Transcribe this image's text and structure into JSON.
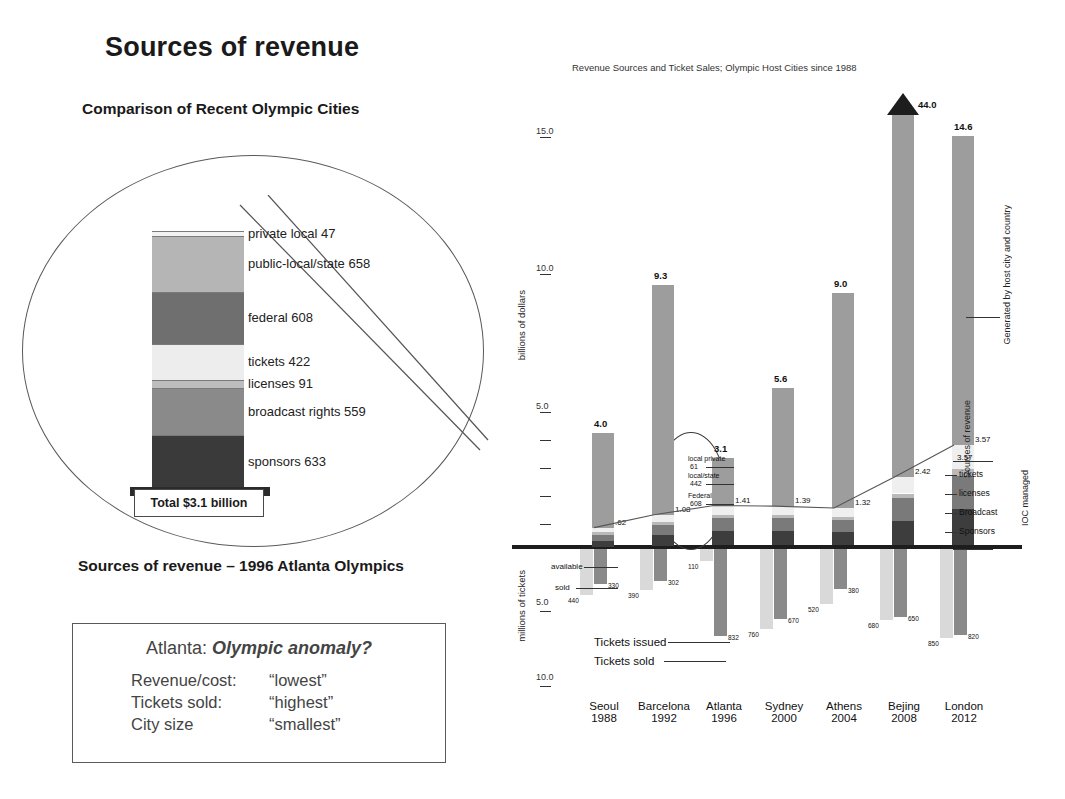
{
  "slide": {
    "title": "Sources of revenue",
    "compare_subtitle": "Comparison of Recent Olympic Cities",
    "atlanta_caption": "Sources of revenue – 1996 Atlanta Olympics"
  },
  "callout": {
    "total_label": "Total $3.1 billion",
    "segments": [
      {
        "label": "private  local  47",
        "value": 47,
        "color": "#f2f2f2"
      },
      {
        "label": "public-local/state 658",
        "value": 658,
        "color": "#b5b5b5"
      },
      {
        "label": "federal 608",
        "value": 608,
        "color": "#6f6f6f"
      },
      {
        "label": "tickets  422",
        "value": 422,
        "color": "#ededed"
      },
      {
        "label": "licenses  91",
        "value": 91,
        "color": "#bdbdbd"
      },
      {
        "label": "broadcast rights  559",
        "value": 559,
        "color": "#8a8a8a"
      },
      {
        "label": "sponsors  633",
        "value": 633,
        "color": "#3a3a3a"
      }
    ]
  },
  "anomaly": {
    "title_prefix": "Atlanta: ",
    "title_italic": "Olympic anomaly?",
    "rows": [
      {
        "key": "Revenue/cost:",
        "value": "“lowest”"
      },
      {
        "key": "Tickets sold:",
        "value": "“highest”"
      },
      {
        "key": "City size",
        "value": "“smallest”"
      }
    ]
  },
  "chart_data": {
    "type": "bar",
    "title": "Revenue Sources and Ticket Sales; Olympic Host Cities since 1988",
    "ylabel_top": "billions of dollars",
    "ylabel_bottom": "millions of tickets",
    "yticks_top": [
      "15.0",
      "10.0",
      "5.0"
    ],
    "yticks_bottom": [
      "5.0",
      "10.0"
    ],
    "categories": [
      "Seoul",
      "Barcelona",
      "Atlanta",
      "Sydney",
      "Athens",
      "Bejing",
      "London"
    ],
    "years": [
      "1988",
      "1992",
      "1996",
      "2000",
      "2004",
      "2008",
      "2012"
    ],
    "series": [
      {
        "name": "Total revenue (billions $)",
        "values": [
          4.0,
          9.3,
          3.1,
          5.6,
          9.0,
          44.0,
          14.6
        ]
      },
      {
        "name": "IOC-managed sources (billions $)",
        "values": [
          0.62,
          1.08,
          1.41,
          1.39,
          1.32,
          2.42,
          3.57
        ]
      },
      {
        "name": "Tickets issued (millions)",
        "values": [
          440,
          390,
          110,
          760,
          520,
          680,
          850
        ]
      },
      {
        "name": "Tickets sold (millions)",
        "values": [
          330,
          302,
          832,
          670,
          380,
          650,
          820
        ]
      }
    ],
    "value_labels_top": [
      "4.0",
      "9.3",
      "3.1",
      "5.6",
      "9.0",
      "44.0",
      "14.6"
    ],
    "value_labels_ioc": [
      ".62",
      "1.08",
      "1.41",
      "1.39",
      "1.32",
      "2.42",
      "3.57"
    ],
    "tickets_issued_labels": [
      "440",
      "390",
      "110",
      "760",
      "520",
      "680",
      "850"
    ],
    "tickets_sold_labels": [
      "330",
      "302",
      "832",
      "670",
      "380",
      "650",
      "820"
    ],
    "beijing_offscale_note": "44.0",
    "ticket_bar_annotations": [
      {
        "label": "available"
      },
      {
        "label": "sold"
      }
    ],
    "ticket_legend": [
      "Tickets issued",
      "Tickets sold"
    ],
    "atlanta_annotations": [
      {
        "label": "local private",
        "value": "61"
      },
      {
        "label": "local/state",
        "value": "442"
      },
      {
        "label": "Federal",
        "value": "608"
      }
    ],
    "right_legend": {
      "top_value": "3.57",
      "items": [
        "tickets",
        "licenses",
        "Broadcast",
        "Sponsors"
      ],
      "group_ioc": "IOC managed",
      "group_sources": "Sources of revenue",
      "group_host": "Generated by host city and country"
    }
  }
}
